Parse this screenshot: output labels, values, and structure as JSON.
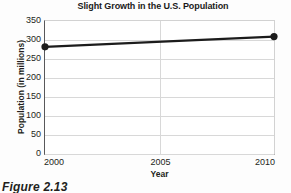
{
  "figure": {
    "caption": "Figure 2.13"
  },
  "chart_data": {
    "type": "line",
    "title": "Slight Growth in the U.S. Population",
    "xlabel": "Year",
    "ylabel": "Population (in millions)",
    "x": [
      2000,
      2010
    ],
    "values": [
      282,
      309
    ],
    "series": [
      {
        "name": "U.S. Population",
        "values": [
          282,
          309
        ]
      }
    ],
    "xlim": [
      2000,
      2010
    ],
    "ylim": [
      0,
      350
    ],
    "xticks": [
      "2000",
      "2005",
      "2010"
    ],
    "xtick_values": [
      2000,
      2005,
      2010
    ],
    "yticks": [
      "0",
      "50",
      "100",
      "150",
      "200",
      "250",
      "300",
      "350"
    ],
    "ytick_values": [
      0,
      50,
      100,
      150,
      200,
      250,
      300,
      350
    ],
    "grid": true,
    "legend": false,
    "marker": "filled-circle",
    "line_color": "#1c1c1c",
    "marker_color": "#1c1c1c",
    "grid_color": "#d8d8d8",
    "axis_color": "#58585a"
  }
}
